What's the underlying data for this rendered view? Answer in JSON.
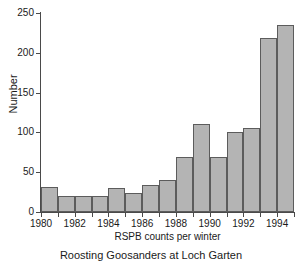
{
  "caption": "Roosting Goosanders at Loch Garten",
  "colors": {
    "bar_fill": "#b4b4b4",
    "bar_edge": "#5c5c5c",
    "axis": "#4a4a4a",
    "text": "#1a1a1a",
    "background": "#ffffff"
  },
  "chart_data": {
    "type": "bar",
    "title": "Roosting Goosanders at Loch Garten",
    "subtitle": "",
    "xlabel": "RSPB counts per winter",
    "ylabel": "Number",
    "categories": [
      "1980",
      "1981",
      "1982",
      "1983",
      "1984",
      "1985",
      "1986",
      "1987",
      "1988",
      "1989",
      "1990",
      "1991",
      "1992",
      "1993",
      "1994"
    ],
    "values": [
      31,
      20,
      20,
      20,
      30,
      24,
      34,
      40,
      69,
      110,
      69,
      100,
      105,
      218,
      235
    ],
    "xlim": [
      1980,
      1995
    ],
    "ylim": [
      0,
      250
    ],
    "ytick_values": [
      0,
      50,
      100,
      150,
      200,
      250
    ],
    "ytick_labels": [
      "0",
      "50",
      "100",
      "150",
      "200",
      "250"
    ],
    "xtick_values": [
      1980,
      1982,
      1984,
      1986,
      1988,
      1990,
      1992,
      1994
    ],
    "xtick_labels": [
      "1980",
      "1982",
      "1984",
      "1986",
      "1988",
      "1990",
      "1992",
      "1994"
    ],
    "grid": false,
    "legend": false,
    "legend_position": "none",
    "bar_align": "edge"
  }
}
